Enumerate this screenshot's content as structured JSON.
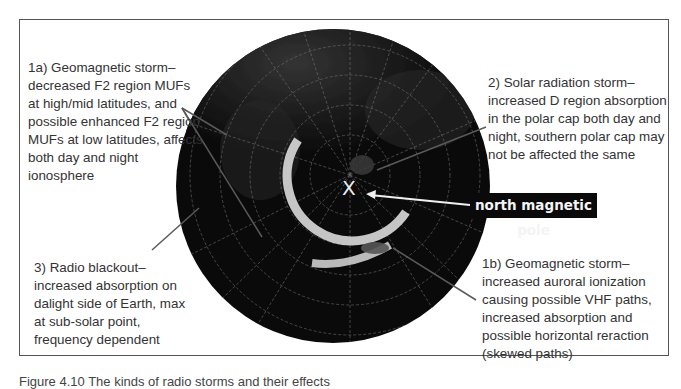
{
  "figure": {
    "caption": "Figure 4.10 The kinds of radio storms and their effects",
    "pole_marker": "X",
    "pole_label": "north magnetic pole",
    "globe": {
      "center": [
        333,
        186
      ],
      "radius": 157,
      "fill": "#0b0b0b",
      "aurora_color": "#d8d8d8"
    },
    "notes": {
      "geomag_1a": "1a) Geomagnetic storm– decreased F2 region MUFs at high/mid latitudes, and possible enhanced F2 region MUFs at low latitudes, affects both day and night ionosphere",
      "solar_2": "2) Solar radiation storm– increased D region absorption in the polar cap both day and night, southern polar cap may not be affected the same",
      "blackout_3": "3) Radio blackout– increased absorption on dalight side of Earth, max at sub-solar point, frequency dependent",
      "geomag_1b": "1b) Geomagnetic storm– increased auroral ionization causing possible VHF paths, increased absorption and possible horizontal reraction (skewed paths)"
    }
  }
}
